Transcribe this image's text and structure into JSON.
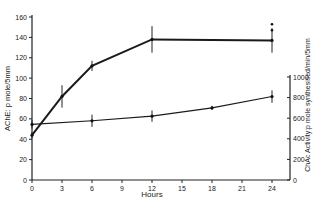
{
  "chart_data": {
    "type": "line",
    "title": "",
    "xlabel": "Hours",
    "ylabel": "AChE: p mole/5mm",
    "ylabel_right": "ChAc Activity:p mole synthesised/min/5mm",
    "x_ticks": [
      0,
      3,
      6,
      9,
      12,
      15,
      18,
      21,
      24
    ],
    "y_ticks": [
      0,
      20,
      40,
      60,
      80,
      100,
      120,
      140,
      160
    ],
    "y_right_ticks": [
      0,
      200,
      400,
      600,
      800,
      1000
    ],
    "xlim": [
      0,
      24
    ],
    "ylim": [
      0,
      160
    ],
    "ylim_right": [
      0,
      1000
    ],
    "grid": false,
    "legend": "none",
    "series": [
      {
        "name": "AChE",
        "axis": "left",
        "style": "bold",
        "x": [
          0,
          3,
          6,
          12,
          24
        ],
        "values": [
          44,
          82,
          112,
          138,
          137
        ],
        "error": [
          3,
          11,
          5,
          13,
          12
        ]
      },
      {
        "name": "ChAc Activity",
        "axis": "right",
        "style": "thin",
        "x": [
          0,
          6,
          12,
          18,
          24
        ],
        "values": [
          540,
          575,
          620,
          700,
          810
        ],
        "error": [
          40,
          60,
          55,
          20,
          60
        ]
      }
    ],
    "annotations": [
      {
        "x": 24,
        "y": 150,
        "axis": "left",
        "note": "additional marker points above 24h AChE value"
      }
    ]
  }
}
